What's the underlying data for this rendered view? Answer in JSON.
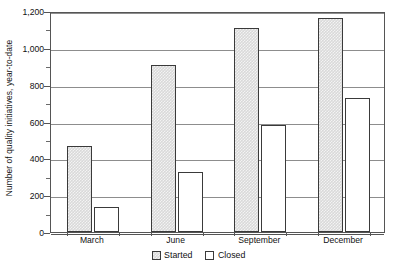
{
  "chart_data": {
    "type": "bar",
    "title": "",
    "subtitle": "",
    "xlabel": "",
    "ylabel": "Number of quality initiatives, year-to-date",
    "categories": [
      "March",
      "June",
      "September",
      "December"
    ],
    "series": [
      {
        "name": "Started",
        "values": [
          465,
          905,
          1110,
          1160
        ],
        "fill": "#d9d9d9",
        "pattern": "checker",
        "border": "#3a3a3a"
      },
      {
        "name": "Closed",
        "values": [
          135,
          325,
          580,
          730
        ],
        "fill": "#ffffff",
        "pattern": "solid",
        "border": "#3a3a3a"
      }
    ],
    "ylim": [
      0,
      1200
    ],
    "ytick_values": [
      0,
      200,
      400,
      600,
      800,
      1000,
      1200
    ],
    "ytick_labels": [
      "0",
      "200",
      "400",
      "600",
      "800",
      "1,000",
      "1,200"
    ],
    "yminor_tick_values": [
      100,
      300,
      500,
      700,
      900,
      1100
    ],
    "grid": {
      "horizontal": true,
      "vertical": false,
      "color": "#8d8d8d"
    },
    "legend": {
      "position": "bottom-center",
      "entries": [
        "Started",
        "Closed"
      ]
    },
    "frame": {
      "color": "#555555",
      "all_sides": true
    },
    "background": "#ffffff"
  }
}
